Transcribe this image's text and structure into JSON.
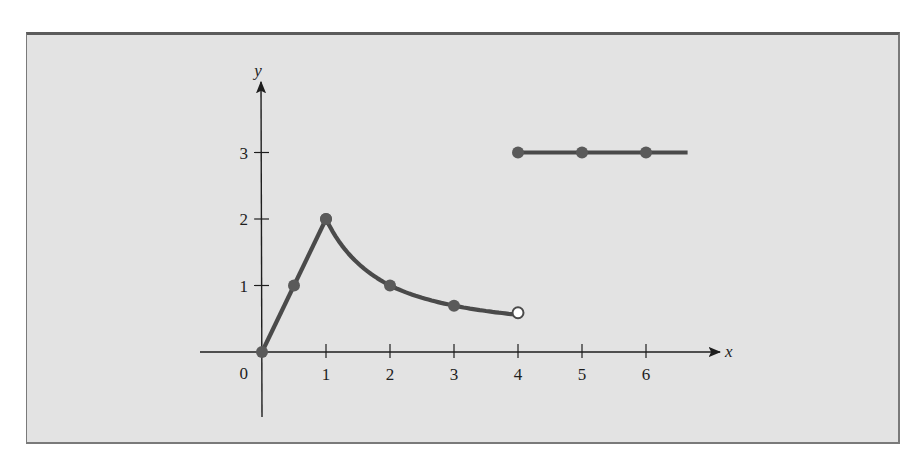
{
  "chart_data": {
    "type": "line",
    "title": "",
    "xlabel": "x",
    "ylabel": "y",
    "x_ticks": [
      "1",
      "2",
      "3",
      "4",
      "5",
      "6"
    ],
    "y_ticks": [
      "1",
      "2",
      "3"
    ],
    "origin_label": "0",
    "xlim": [
      -1,
      7
    ],
    "ylim": [
      -1,
      4
    ],
    "grid": false,
    "legend": null,
    "series": [
      {
        "name": "segment-1-linear",
        "description": "straight line from (0,0) to (1,2)",
        "points": [
          [
            0,
            0
          ],
          [
            0.5,
            1
          ],
          [
            1,
            2
          ]
        ],
        "marked_points": [
          [
            0,
            0
          ],
          [
            0.5,
            1
          ],
          [
            1,
            2
          ]
        ]
      },
      {
        "name": "segment-2-curve",
        "description": "decreasing curve y = 2/x from (1,2) to (4,0.5), open endpoint at x=4",
        "points": [
          [
            1,
            2
          ],
          [
            1.5,
            1.333
          ],
          [
            2,
            1
          ],
          [
            2.5,
            0.8
          ],
          [
            3,
            0.667
          ],
          [
            3.5,
            0.571
          ],
          [
            4,
            0.5
          ]
        ],
        "marked_points": [
          [
            1,
            2
          ],
          [
            2,
            1
          ],
          [
            3,
            0.667
          ]
        ],
        "open_point": [
          4,
          0.5
        ]
      },
      {
        "name": "segment-3-constant",
        "description": "horizontal line y = 3 for x >= 4",
        "points": [
          [
            4,
            3
          ],
          [
            6.65,
            3
          ]
        ],
        "marked_points": [
          [
            4,
            3
          ],
          [
            5,
            3
          ],
          [
            6,
            3
          ]
        ]
      }
    ],
    "colors": {
      "background": "#e3e3e3",
      "curve": "#4a4a4a",
      "axis": "#1e1e1e",
      "frame": "#6e6e6e"
    }
  }
}
